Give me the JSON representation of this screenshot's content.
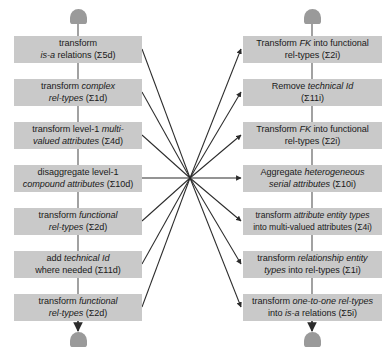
{
  "figure": {
    "type": "flowchart",
    "caption": "",
    "colors": {
      "box_fill": "#c9c9c9",
      "terminal_fill": "#9a9a9a",
      "edge": "#2b2b2b",
      "background": "#ffffff",
      "text": "#1a1a1a"
    },
    "hub": {
      "x": 190,
      "y": 178,
      "label": "crossing-point"
    }
  },
  "left_column": {
    "name": "direct-transformation-chain",
    "start_terminal": "start-node-left",
    "end_terminal": "end-node-left",
    "steps": [
      {
        "id": "d5",
        "line1_plain": "transform",
        "line1_italic": "",
        "line2_italic": "is-a",
        "line2_plain": " relations (Σ5d)",
        "text": "transform is-a relations (Σ5d)",
        "code": "Σ5d"
      },
      {
        "id": "d1",
        "line1_plain": "transform ",
        "line1_italic": "complex",
        "line2_italic": "rel-types",
        "line2_plain": " (Σ1d)",
        "text": "transform complex rel-types (Σ1d)",
        "code": "Σ1d"
      },
      {
        "id": "d4",
        "line1_plain": "transform level-1 ",
        "line1_italic": "multi-",
        "line2_italic": "valued attributes",
        "line2_plain": " (Σ4d)",
        "text": "transform level-1 multi-valued attributes (Σ4d)",
        "code": "Σ4d"
      },
      {
        "id": "d10",
        "line1_plain": "disaggregate level-1",
        "line1_italic": "",
        "line2_italic": "compound attributes",
        "line2_plain": " (Σ10d)",
        "text": "disaggregate level-1 compound attributes (Σ10d)",
        "code": "Σ10d"
      },
      {
        "id": "d2a",
        "line1_plain": "transform ",
        "line1_italic": "functional",
        "line2_italic": "rel-types",
        "line2_plain": " (Σ2d)",
        "text": "transform functional rel-types (Σ2d)",
        "code": "Σ2d"
      },
      {
        "id": "d11",
        "line1_plain": "add ",
        "line1_italic": "technical Id",
        "line2_italic": "",
        "line2_plain": "where needed (Σ11d)",
        "text": "add technical Id where needed (Σ11d)",
        "code": "Σ11d"
      },
      {
        "id": "d2b",
        "line1_plain": "transform ",
        "line1_italic": "functional",
        "line2_italic": "rel-types",
        "line2_plain": " (Σ2d)",
        "text": "transform functional rel-types (Σ2d)",
        "code": "Σ2d"
      }
    ]
  },
  "right_column": {
    "name": "inverse-transformation-chain",
    "start_terminal": "start-node-right",
    "end_terminal": "end-node-right",
    "steps": [
      {
        "id": "i2a",
        "line1_plain": "Transform ",
        "line1_italic": "FK",
        "line1_plain2": " into functional",
        "line2_italic": "",
        "line2_plain": "rel-types (Σ2i)",
        "text": "Transform FK into functional rel-types (Σ2i)",
        "code": "Σ2i"
      },
      {
        "id": "i11",
        "line1_plain": "Remove ",
        "line1_italic": "technical Id",
        "line1_plain2": "",
        "line2_italic": "",
        "line2_plain": "(Σ11i)",
        "text": "Remove technical Id (Σ11i)",
        "code": "Σ11i"
      },
      {
        "id": "i2b",
        "line1_plain": "Transform ",
        "line1_italic": "FK",
        "line1_plain2": " into functional",
        "line2_italic": "",
        "line2_plain": "rel-types (Σ2i)",
        "text": "Transform FK into functional rel-types (Σ2i)",
        "code": "Σ2i"
      },
      {
        "id": "i10",
        "line1_plain": "Aggregate ",
        "line1_italic": "heterogeneous",
        "line1_plain2": "",
        "line2_italic": "serial attributes",
        "line2_plain": " (Σ10i)",
        "text": "Aggregate heterogeneous serial attributes (Σ10i)",
        "code": "Σ10i"
      },
      {
        "id": "i4",
        "line1_plain": "transform ",
        "line1_italic": "attribute entity types",
        "line1_plain2": "",
        "line2_italic": "",
        "line2_plain": "into multi-valued attributes (Σ4i)",
        "text": "transform attribute entity types into multi-valued attributes (Σ4i)",
        "code": "Σ4i"
      },
      {
        "id": "i1",
        "line1_plain": "transform ",
        "line1_italic": "relationship entity",
        "line1_plain2": "",
        "line2_italic": "types",
        "line2_plain": " into rel-types (Σ1i)",
        "text": "transform relationship entity types into rel-types (Σ1i)",
        "code": "Σ1i"
      },
      {
        "id": "i5",
        "line1_plain": "transform ",
        "line1_italic": "one-to-one rel-types",
        "line1_plain2": "",
        "line2_plain": "into ",
        "line2_italic": "is-a",
        "line2_plain2": " relations (Σ5i)",
        "text": "transform one-to-one rel-types into is-a relations (Σ5i)",
        "code": "Σ5i"
      }
    ]
  },
  "edges": {
    "description": "seven lines from each left step converge at a hub then fan out as arrows to each right step",
    "count_in": 7,
    "count_out": 7
  }
}
